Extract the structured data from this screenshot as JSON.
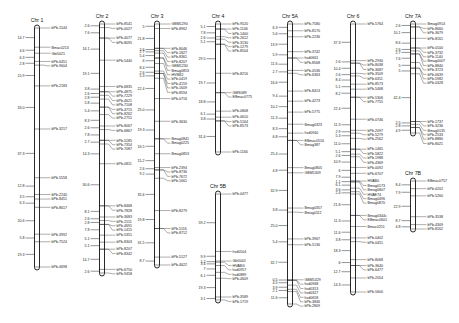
{
  "figure": {
    "type": "genetic linkage map",
    "chromosomes": [
      {
        "name": "Chr 1",
        "distances": [
          "14.7",
          "4.6",
          "6.3",
          "2.8",
          "15.9",
          "33.0",
          "37.3",
          "12.8",
          "3.5",
          "6.3",
          "20.6",
          "5.8",
          "19.3"
        ],
        "markers": [
          "bPb-1544",
          "Bmac0213",
          "Gbi5021",
          "bPb-6451",
          "bPb-9604",
          "bPb-2183",
          "bPb-3217",
          "bPb-5558",
          "bPb-2240",
          "bPb-8451",
          "bPb-8617",
          "bPb-3992",
          "bPb-7524",
          "bPb-4698"
        ]
      },
      {
        "name": "Chr 2",
        "distances": [
          "2.6",
          "7.6",
          "16.1",
          "19.1",
          "3.8",
          "2.6",
          "2.8",
          "5.8",
          "5.4",
          "8.3",
          "2.6",
          "7.8",
          "2.7",
          "14.3",
          "30.6",
          "8.1",
          "2.6",
          "2.8",
          "7.8",
          "5.1",
          "5.1",
          "14.7",
          "2.6"
        ],
        "markers": [
          "bPb-8541",
          "bPb-0027",
          "bPb-4077",
          "bPb-8095",
          "bPb-5440",
          "bPb-6835",
          "bPb-4875",
          "bPb-7229",
          "bPb-4621",
          "bPb-7108",
          "bPb-4715",
          "bPb-8262",
          "bPb-2751",
          "bPb-8067",
          "bPb-6867",
          "bPb-5185",
          "bPb-7354",
          "bPb-7087",
          "bPb-0811",
          "bPb-8468",
          "bPb-7828",
          "bPb-3683",
          "bPb-1511",
          "bPb-4691",
          "bPb-1415",
          "bPb-5351",
          "bPb-8303",
          "bPb-8207",
          "bPb-8342",
          "bPb-6750",
          "bPb-9458"
        ]
      },
      {
        "name": "Chr 3",
        "distances": [
          "5",
          "21.8",
          "2.6",
          "2.7",
          "5.4",
          "6",
          "8.4",
          "2.6",
          "5.3",
          "22.4",
          "25.0",
          "19.3",
          "16.5",
          "15.2",
          "2.6",
          "9.2",
          "35.6",
          "19.8",
          "31.5",
          "8.7"
        ],
        "markers": [
          "GBM1290",
          "bPb-8962",
          "bPb-8046",
          "bPb-1827",
          "bPb-8361",
          "bPb-8207",
          "GBM1230",
          "Bmag0853",
          "HVM62",
          "bPb-0419",
          "bPb-4159",
          "bPb-1609",
          "bPb-8594",
          "bPb-0716",
          "bPb-3630",
          "Bmag0841",
          "Bmag0225",
          "Bmag0853",
          "bPb-2394",
          "bPb-8736",
          "bPb-7672",
          "bPb-1661",
          "bPb-8279",
          "bPb-5116",
          "bPb-8712",
          "bPb-5127",
          "bPb-4622"
        ]
      },
      {
        "name": "Chr 4",
        "distances": [
          "5.1",
          "7.8",
          "2.6",
          "5.1",
          "29.5",
          "19.7",
          "18.8",
          "6.1",
          "3.8",
          "31.6"
        ],
        "markers": [
          "bPb-9520",
          "bPb-1146",
          "bPb-1400",
          "bPb-2612",
          "bPb-3130",
          "bPb-1279",
          "bPb-8504",
          "bPb-8216",
          "GMS089",
          "EBmac0775",
          "bPb-0808",
          "bPb-0610",
          "bPb-5164",
          "bPb-8573",
          "bPb-1166"
        ]
      },
      {
        "name": "Chr 5B",
        "distances": [
          "59.2",
          "9.9",
          "1.2",
          "3.4",
          "7",
          "6.1",
          "19.3",
          "3.1"
        ],
        "markers": [
          "bPb-0477",
          "hvd0504",
          "Gbi5001",
          "HVABG",
          "hvd0957",
          "hvd0889",
          "bPb-4609",
          "bPb-3589",
          "bPb-1719"
        ]
      },
      {
        "name": "Chr 5A",
        "distances": [
          "6.3",
          "5.6",
          "13.9",
          "5.9",
          "11.6",
          "2.7",
          "16.6",
          "9.4",
          "10.2",
          "11.3",
          "8.3",
          "6.8",
          "25.4",
          "4.8",
          "32.9",
          "3.8",
          "25.0",
          "5.4",
          "32.7",
          "0.5",
          "4.5",
          "3.9",
          "2.1",
          "11.6"
        ],
        "markers": [
          "bPb-7580",
          "bPb-8170",
          "bPb-2236",
          "bPb-3742",
          "hvd0661",
          "bPb-8568",
          "bPb-0536",
          "bPb-6363",
          "bPb-8413",
          "bPb-4273",
          "bPb-5775",
          "Bmag0323",
          "hvd0940",
          "EBmac0516",
          "Bmag387",
          "Bmag0805",
          "GBM1309",
          "Bmag0357",
          "Bmag0112",
          "bPb-3967",
          "bPb-5136",
          "GBM1429",
          "hvd0968",
          "hvd0313",
          "hvd0327",
          "hvd0658",
          "bPb-3846",
          "bPb-2809"
        ]
      },
      {
        "name": "Chr 6",
        "distances": [
          "37.3",
          "2.6",
          "10.4",
          "2.6",
          "8.4",
          "5.1",
          "8.2",
          "22.4",
          "11.3",
          "2.9",
          "5.3",
          "11.0",
          "5.1",
          "2.6",
          "10.9",
          "6",
          "7.9",
          "1.1",
          "6.1",
          "3.6",
          "2.4",
          "21.8",
          "11.3",
          "11.6",
          "3.8",
          "18.3",
          "6",
          "12.7",
          "14.3"
        ],
        "markers": [
          "bPb-5764",
          "bPb-2930",
          "bPb-8038",
          "bPb-3687",
          "bPb-3509",
          "bPb-6311",
          "bPb-8573",
          "bPb-5468",
          "bPb-5306",
          "bPb-7755",
          "bPb-0746",
          "bPb-2097",
          "bPb-5279",
          "bPb-2562",
          "bPb-1465",
          "bPb-5822",
          "bPb-1988",
          "bPb-4369",
          "bPb-0092",
          "bPb-6707",
          "HVAB0",
          "Bmag0173",
          "Bmag0807",
          "HVAE74",
          "Bmag0496",
          "Bmag0870",
          "Bmag0344c",
          "EBmac0601",
          "Bmac0251",
          "bPb-0402",
          "bPb-0451",
          "bPb-8068",
          "bPb-3640",
          "bPb-6477",
          "bPb-2054",
          "bPb-5600"
        ]
      },
      {
        "name": "Chr 7A",
        "distances": [
          "2.6",
          "10.1",
          "8.6",
          "2.6",
          "2.7",
          "7.6",
          "5",
          "5",
          "42.4",
          "2.5",
          "2.8",
          "4.9"
        ],
        "markers": [
          "Bmag0914",
          "bPb-8660",
          "bPb-3679",
          "bPb-8161",
          "bPb-0100",
          "bPb-3732",
          "bPb-1140",
          "Bmag0007",
          "bPb-8840",
          "bPb-3723",
          "bPb-0639",
          "bPb-5982",
          "bPb-0328",
          "bPb-1737",
          "bPb-3236",
          "Bmag0135",
          "bPb-2533",
          "bPb-8880",
          "bPb-8021"
        ]
      },
      {
        "name": "Chr 7B",
        "distances": [
          "8.4",
          "7.9",
          "22.9",
          "8.7",
          "4.8"
        ],
        "markers": [
          "EBmac0757",
          "bPb-0202",
          "bPb-5260",
          "bPb-3538",
          "bPb-4309",
          "bPb-8162"
        ]
      }
    ]
  }
}
